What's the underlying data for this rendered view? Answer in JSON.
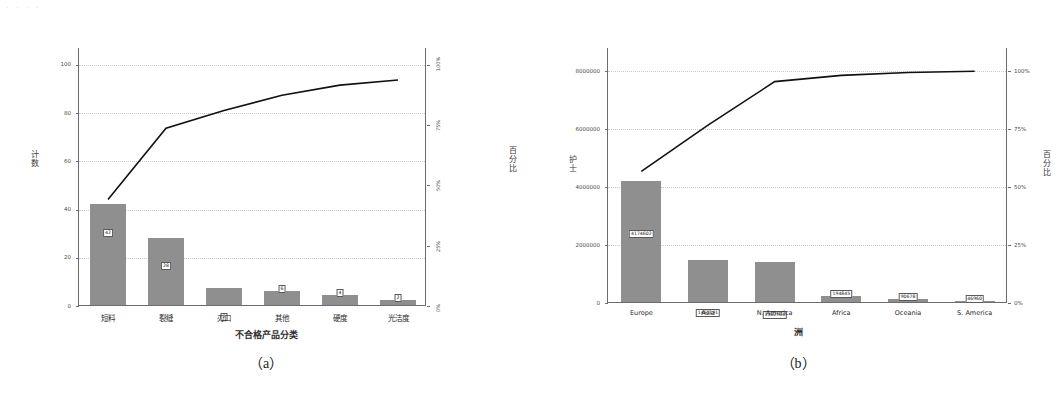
{
  "artifact_text": "· · ·  ·",
  "figures": [
    {
      "id": "a",
      "caption": "（a）",
      "xtitle": "不合格产品分类",
      "ytitle_left": "计数",
      "ytitle_right": "百分比",
      "chart_data": {
        "type": "bar",
        "title": "",
        "subtitle": "",
        "xlabel": "不合格产品分类",
        "ylabel": "计数",
        "y2label": "百分比",
        "categories": [
          "短料",
          "裂缝",
          "刃口",
          "其他",
          "硬度",
          "光洁度"
        ],
        "values": [
          42,
          28,
          7,
          6,
          4,
          2
        ],
        "value_labels": [
          "42",
          "28",
          "7",
          "6",
          "4",
          "2"
        ],
        "series": [
          {
            "name": "计数",
            "values": [
              42,
              28,
              7,
              6,
              4,
              2
            ]
          },
          {
            "name": "累积百分比",
            "values": [
              44.2,
              73.7,
              81.1,
              87.4,
              91.6,
              93.7
            ]
          }
        ],
        "cumulative_percent": [
          44.2,
          73.7,
          81.1,
          87.4,
          91.6,
          93.7
        ],
        "yticks": [
          "0",
          "20",
          "40",
          "60",
          "80",
          "100"
        ],
        "ytick_values": [
          0,
          20,
          40,
          60,
          80,
          100
        ],
        "ylim": [
          0,
          107
        ],
        "y2ticks": [
          "0%",
          "25%",
          "50%",
          "75%",
          "100%"
        ],
        "y2tick_values": [
          0,
          25,
          50,
          75,
          100
        ],
        "y2lim": [
          0,
          107
        ],
        "grid": true,
        "legend": "none"
      }
    },
    {
      "id": "b",
      "caption": "（b）",
      "xtitle": "洲",
      "ytitle_left": "护士",
      "ytitle_right": "百分比",
      "chart_data": {
        "type": "bar",
        "title": "",
        "subtitle": "",
        "xlabel": "洲",
        "ylabel": "护士",
        "y2label": "百分比",
        "categories": [
          "Europe",
          "Asia",
          "N. America",
          "Africa",
          "Oceania",
          "S. America"
        ],
        "values": [
          4174602,
          1463191,
          1382764,
          194845,
          90678,
          46960
        ],
        "value_labels": [
          "4174602",
          "1463191",
          "1382764",
          "194845",
          "90678",
          "46960"
        ],
        "series": [
          {
            "name": "护士",
            "values": [
              4174602,
              1463191,
              1382764,
              194845,
              90678,
              46960
            ]
          },
          {
            "name": "累积百分比",
            "values": [
              56.8,
              76.7,
              95.5,
              98.2,
              99.4,
              100.0
            ]
          }
        ],
        "cumulative_percent": [
          56.8,
          76.7,
          95.5,
          98.2,
          99.4,
          100.0
        ],
        "yticks": [
          "0",
          "2000000",
          "4000000",
          "6000000",
          "8000000"
        ],
        "ytick_values": [
          0,
          2000000,
          4000000,
          6000000,
          8000000
        ],
        "ylim": [
          0,
          8800000
        ],
        "y2ticks": [
          "0%",
          "25%",
          "50%",
          "75%",
          "100%"
        ],
        "y2tick_values": [
          0,
          25,
          50,
          75,
          100
        ],
        "y2lim": [
          0,
          110
        ],
        "grid": true,
        "legend": "none"
      }
    }
  ]
}
